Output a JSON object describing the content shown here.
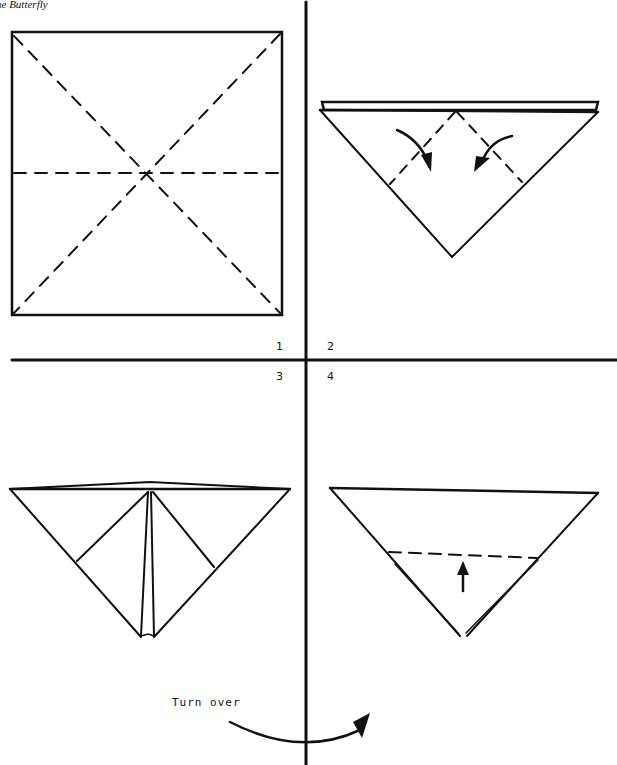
{
  "header": {
    "title": "he Butterfly"
  },
  "steps": [
    {
      "number": "1",
      "description": "Square with diagonal and horizontal valley-fold creases"
    },
    {
      "number": "2",
      "description": "Folded triangle; fold corners down toward center"
    },
    {
      "number": "3",
      "description": "Triangle with flaps folded along center"
    },
    {
      "number": "4",
      "description": "Triangle; fold bottom point up along dashed line"
    }
  ],
  "annotations": {
    "turn_over": "Turn over"
  },
  "colors": {
    "ink": "#111111",
    "paper": "#ffffff"
  }
}
